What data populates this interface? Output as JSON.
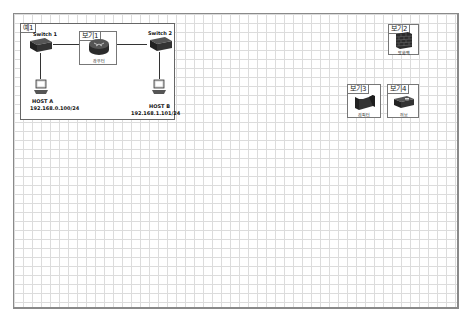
{
  "diagram": {
    "main_box": {
      "tag": "예1",
      "switch1": "Switch 1",
      "switch2": "Switch 2",
      "router_box_tag": "보기1",
      "router_label": "라우터",
      "host_a_name": "HOST A",
      "host_a_ip": "192.168.0.100/24",
      "host_b_name": "HOST B",
      "host_b_ip": "192.168.1.101/24"
    },
    "options": [
      {
        "tag": "보기2",
        "label": "방화벽",
        "icon": "firewall-icon"
      },
      {
        "tag": "보기3",
        "label": "리피터",
        "icon": "bridge-icon"
      },
      {
        "tag": "보기4",
        "label": "허브",
        "icon": "hub-icon"
      }
    ]
  },
  "colors": {
    "grid_line": "#dcdcdc",
    "border": "#8a8a8a",
    "device": "#2b2b2b"
  }
}
